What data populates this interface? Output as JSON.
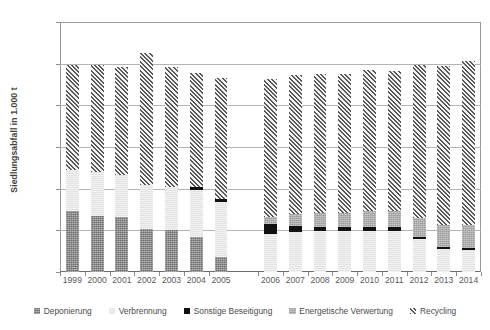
{
  "chart_data": {
    "type": "bar",
    "subtype": "stacked-bar",
    "title": "",
    "xlabel": "",
    "ylabel": "Siedlungsabfall in 1.000 t",
    "ylim": [
      0,
      60000
    ],
    "ytick_values": [
      0,
      10000,
      20000,
      30000,
      40000,
      50000,
      60000
    ],
    "ytick_labels": [
      "0",
      "10 000",
      "20 000",
      "30 000",
      "40 000",
      "50 000",
      "60 000"
    ],
    "grid": true,
    "grid_axis": "y",
    "legend_position": "bottom",
    "categories": [
      "1999",
      "2000",
      "2001",
      "2002",
      "2003",
      "2004",
      "2005",
      "2006",
      "2007",
      "2008",
      "2009",
      "2010",
      "2011",
      "2012",
      "2013",
      "2014"
    ],
    "category_gap_after": "2005",
    "series": [
      {
        "name": "Deponierung",
        "color": "#6e6e6e",
        "pattern": "fine-grid",
        "values": [
          14600,
          13500,
          13300,
          10300,
          10100,
          8500,
          3500,
          0,
          0,
          0,
          0,
          0,
          0,
          0,
          0,
          0
        ]
      },
      {
        "name": "Verbrennung",
        "color": "#e3e3e3",
        "pattern": "light-horizontal",
        "values": [
          9900,
          10600,
          10100,
          10500,
          10300,
          11200,
          13300,
          9200,
          9700,
          9900,
          9900,
          9900,
          9800,
          7900,
          5500,
          5200
        ]
      },
      {
        "name": "Sonstige Beseitigung",
        "color": "#111111",
        "pattern": "solid",
        "values": [
          0,
          0,
          0,
          0,
          0,
          700,
          800,
          2300,
          1300,
          1000,
          800,
          900,
          900,
          500,
          600,
          600
        ]
      },
      {
        "name": "Energetische Verwertung",
        "color": "#9c9c9c",
        "pattern": "medium-grid",
        "values": [
          0,
          0,
          0,
          0,
          0,
          0,
          0,
          1800,
          3000,
          3300,
          3500,
          3800,
          3900,
          4500,
          5200,
          5500
        ]
      },
      {
        "name": "Recycling",
        "color": "#585858",
        "pattern": "diagonal-hatch",
        "values": [
          25200,
          25600,
          25700,
          31800,
          28800,
          27300,
          28900,
          33100,
          33300,
          33300,
          33300,
          33800,
          33600,
          36700,
          38100,
          39400
        ]
      }
    ],
    "totals": [
      49700,
      49700,
      49100,
      52600,
      49200,
      47700,
      46500,
      46400,
      47300,
      47500,
      47500,
      48400,
      48200,
      49600,
      49400,
      50700
    ]
  }
}
